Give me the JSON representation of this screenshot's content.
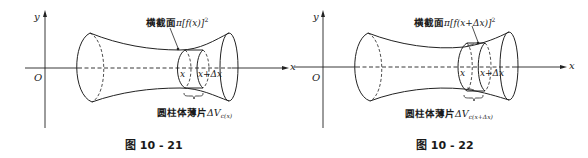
{
  "figures": [
    {
      "caption": "图 10 - 21",
      "axis_y_label": "y",
      "axis_x_label": "x",
      "origin_label": "O",
      "slice_left_label": "x",
      "slice_right_label": "x+Δx",
      "cross_section_prefix": "横截面",
      "cross_section_formula": "π[f(x)]",
      "cross_section_exp": "2",
      "slab_prefix": "圆柱体薄片",
      "slab_symbol": "ΔV",
      "slab_subscript": "c(x)"
    },
    {
      "caption": "图 10 - 22",
      "axis_y_label": "y",
      "axis_x_label": "x",
      "origin_label": "O",
      "slice_left_label": "x",
      "slice_right_label": "x+Δx",
      "cross_section_prefix": "横截面",
      "cross_section_formula": "π[f(x+Δx)]",
      "cross_section_exp": "2",
      "slab_prefix": "圆柱体薄片",
      "slab_symbol": "ΔV",
      "slab_subscript": "c(x+Δx)"
    }
  ]
}
